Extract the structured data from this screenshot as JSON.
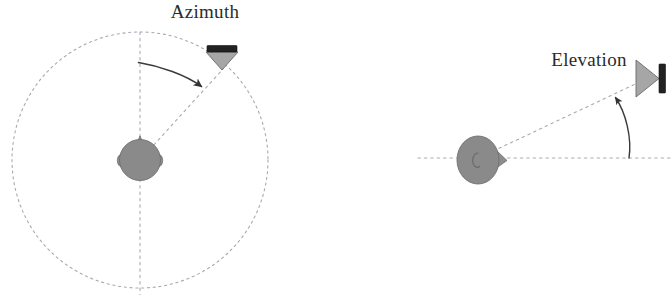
{
  "figure": {
    "title": "",
    "background_color": "#ffffff",
    "width": 672,
    "height": 295
  },
  "colors": {
    "head_fill": "#8a8a8a",
    "head_stroke": "#6f6f6f",
    "speaker_cone_fill": "#a8a8a8",
    "speaker_cone_stroke": "#6b6b6b",
    "speaker_magnet_fill": "#262626",
    "dashed_line": "#a9a9b4",
    "arc_stroke": "#444444",
    "label_text": "#2b2b2b"
  },
  "panels": [
    {
      "id": "azimuth",
      "label": "Azimuth",
      "label_position": {
        "x": 205,
        "y": 18
      },
      "listener": {
        "name": "head-top-view",
        "center": {
          "x": 140,
          "y": 160
        },
        "radius": 21,
        "orientation": "facing-up"
      },
      "speaker": {
        "name": "speaker-top-view",
        "center": {
          "x": 222,
          "y": 62
        },
        "orientation": "cone-pointing-down"
      },
      "reference_circle": {
        "center": {
          "x": 140,
          "y": 160
        },
        "radius": 128,
        "style": "dashed"
      },
      "reference_axis": {
        "from": {
          "x": 140,
          "y": 32
        },
        "to": {
          "x": 140,
          "y": 295
        },
        "style": "dashed",
        "orientation": "vertical"
      },
      "source_ray": {
        "from": {
          "x": 140,
          "y": 160
        },
        "to": {
          "x": 222,
          "y": 68
        },
        "style": "dashed"
      },
      "angle_arc": {
        "from": {
          "x": 139,
          "y": 62
        },
        "to": {
          "x": 203,
          "y": 88
        },
        "arrow": "end",
        "measures": "azimuth angle from front direction"
      }
    },
    {
      "id": "elevation",
      "label": "Elevation",
      "label_position": {
        "x": 589,
        "y": 66
      },
      "listener": {
        "name": "head-side-view",
        "center": {
          "x": 478,
          "y": 160
        },
        "radius_x": 21,
        "radius_y": 24,
        "orientation": "facing-right"
      },
      "speaker": {
        "name": "speaker-side-view",
        "center": {
          "x": 650,
          "y": 78
        },
        "orientation": "cone-pointing-right"
      },
      "reference_axis": {
        "from": {
          "x": 418,
          "y": 158
        },
        "to": {
          "x": 672,
          "y": 158
        },
        "style": "dashed",
        "orientation": "horizontal"
      },
      "source_ray": {
        "from": {
          "x": 470,
          "y": 162
        },
        "to": {
          "x": 644,
          "y": 80
        },
        "style": "dashed"
      },
      "angle_arc": {
        "from": {
          "x": 629,
          "y": 158
        },
        "to": {
          "x": 614,
          "y": 96
        },
        "arrow": "end",
        "measures": "elevation angle from horizontal plane"
      }
    }
  ]
}
